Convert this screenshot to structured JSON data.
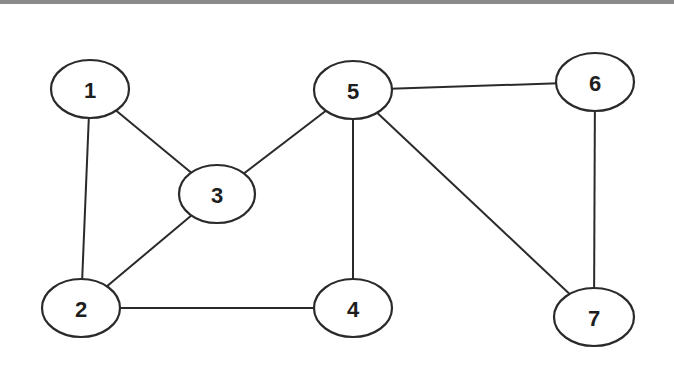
{
  "graph": {
    "type": "undirected",
    "nodes": [
      {
        "id": "1",
        "label": "1",
        "cx": 90,
        "cy": 89,
        "rx": 39,
        "ry": 29
      },
      {
        "id": "2",
        "label": "2",
        "cx": 81,
        "cy": 308,
        "rx": 39,
        "ry": 29
      },
      {
        "id": "3",
        "label": "3",
        "cx": 217,
        "cy": 194,
        "rx": 38,
        "ry": 29
      },
      {
        "id": "4",
        "label": "4",
        "cx": 353,
        "cy": 308,
        "rx": 39,
        "ry": 29
      },
      {
        "id": "5",
        "label": "5",
        "cx": 353,
        "cy": 90,
        "rx": 39,
        "ry": 29
      },
      {
        "id": "6",
        "label": "6",
        "cx": 595,
        "cy": 82,
        "rx": 39,
        "ry": 29
      },
      {
        "id": "7",
        "label": "7",
        "cx": 594,
        "cy": 317,
        "rx": 40,
        "ry": 29
      }
    ],
    "edges": [
      {
        "from": "1",
        "to": "2"
      },
      {
        "from": "1",
        "to": "3"
      },
      {
        "from": "2",
        "to": "3"
      },
      {
        "from": "2",
        "to": "4"
      },
      {
        "from": "3",
        "to": "5"
      },
      {
        "from": "4",
        "to": "5"
      },
      {
        "from": "5",
        "to": "6"
      },
      {
        "from": "5",
        "to": "7"
      },
      {
        "from": "6",
        "to": "7"
      }
    ]
  }
}
